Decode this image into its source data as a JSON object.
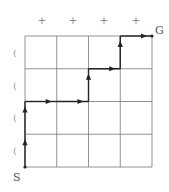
{
  "diagram": {
    "title": "",
    "grid": {
      "cols": 4,
      "rows": 4,
      "line_color": "#777777",
      "path_color": "#222222"
    },
    "labels": {
      "start": "S",
      "goal": "G"
    },
    "top_markers": [
      "+",
      "+",
      "+",
      "+"
    ],
    "side_markers": [
      "(",
      "(",
      "(",
      "("
    ],
    "path": [
      {
        "from": [
          0,
          0
        ],
        "to": [
          0,
          1
        ]
      },
      {
        "from": [
          0,
          1
        ],
        "to": [
          0,
          2
        ]
      },
      {
        "from": [
          0,
          2
        ],
        "to": [
          1,
          2
        ]
      },
      {
        "from": [
          1,
          2
        ],
        "to": [
          2,
          2
        ]
      },
      {
        "from": [
          2,
          2
        ],
        "to": [
          2,
          3
        ]
      },
      {
        "from": [
          2,
          3
        ],
        "to": [
          3,
          3
        ]
      },
      {
        "from": [
          3,
          3
        ],
        "to": [
          3,
          4
        ]
      },
      {
        "from": [
          3,
          4
        ],
        "to": [
          4,
          4
        ]
      }
    ]
  }
}
